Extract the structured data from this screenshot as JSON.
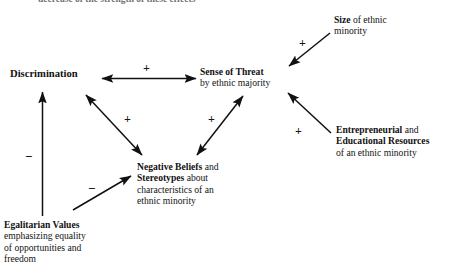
{
  "figure": {
    "type": "path-diagram",
    "clipped_caption_above": "decrease of the strength of these effects"
  },
  "nodes": {
    "discrimination": {
      "id": "discrimination",
      "lines": [
        {
          "bold": "Discrimination",
          "rest": ""
        }
      ]
    },
    "sense_of_threat": {
      "id": "sense-of-threat",
      "lines": [
        {
          "bold": "Sense of Threat",
          "rest": ""
        },
        {
          "bold": "",
          "rest": "by ethnic majority"
        }
      ]
    },
    "size": {
      "id": "size-of-ethnic-minority",
      "lines": [
        {
          "bold": "Size",
          "rest": " of ethnic"
        },
        {
          "bold": "",
          "rest": "minority"
        }
      ]
    },
    "resources": {
      "id": "entrepreneurial-educational-resources",
      "lines": [
        {
          "bold": "Entrepreneurial",
          "rest": " and"
        },
        {
          "bold": "Educational Resources",
          "rest": ""
        },
        {
          "bold": "",
          "rest": "of an ethnic minority"
        }
      ]
    },
    "negative_beliefs": {
      "id": "negative-beliefs-stereotypes",
      "lines": [
        {
          "bold": "Negative Beliefs",
          "rest": " and"
        },
        {
          "bold": "Stereotypes",
          "rest": " about"
        },
        {
          "bold": "",
          "rest": "characteristics of an"
        },
        {
          "bold": "",
          "rest": "ethnic minority"
        }
      ]
    },
    "egalitarian": {
      "id": "egalitarian-values",
      "lines": [
        {
          "bold": "Egalitarian Values",
          "rest": ""
        },
        {
          "bold": "",
          "rest": "emphasizing equality"
        },
        {
          "bold": "",
          "rest": "of opportunities and"
        },
        {
          "bold": "",
          "rest": "freedom"
        }
      ]
    }
  },
  "edges": [
    {
      "id": "discrimination-threat",
      "from": "discrimination",
      "to": "sense_of_threat",
      "sign": "+",
      "arrowheads": "both"
    },
    {
      "id": "size-threat",
      "from": "size",
      "to": "sense_of_threat",
      "sign": "+",
      "arrowheads": "end"
    },
    {
      "id": "resources-threat",
      "from": "resources",
      "to": "sense_of_threat",
      "sign": "+",
      "arrowheads": "end"
    },
    {
      "id": "discrimination-negative-beliefs",
      "from": "discrimination",
      "to": "negative_beliefs",
      "sign": "+",
      "arrowheads": "both"
    },
    {
      "id": "negative-beliefs-threat",
      "from": "negative_beliefs",
      "to": "sense_of_threat",
      "sign": "+",
      "arrowheads": "both"
    },
    {
      "id": "egalitarian-discrimination",
      "from": "egalitarian",
      "to": "discrimination",
      "sign": "−",
      "arrowheads": "end"
    },
    {
      "id": "egalitarian-negative-beliefs",
      "from": "egalitarian",
      "to": "negative_beliefs",
      "sign": "−",
      "arrowheads": "end"
    }
  ],
  "signs": {
    "disc_threat": "+",
    "size_threat": "+",
    "resources_threat": "+",
    "disc_negbeliefs": "+",
    "negbeliefs_threat": "+",
    "egal_disc": "−",
    "egal_negbeliefs": "−"
  },
  "colors": {
    "ink": "#121212",
    "background": "#ffffff"
  }
}
